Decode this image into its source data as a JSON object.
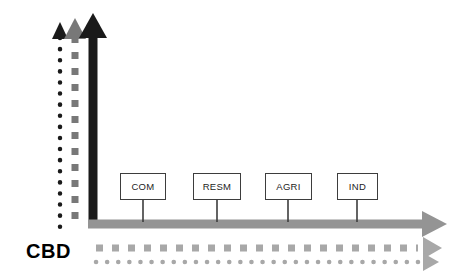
{
  "canvas": {
    "width": 460,
    "height": 278,
    "background": "#ffffff"
  },
  "colors": {
    "black": "#1a1a1a",
    "dark_gray": "#3d3d3d",
    "mid_gray": "#787878",
    "bar_gray": "#949494",
    "light_gray": "#a8a8a8",
    "box_border": "#3d3d3d",
    "box_fill": "#ffffff"
  },
  "cbd": {
    "label": "CBD",
    "x": 26,
    "y": 241
  },
  "nodes": [
    {
      "id": "com",
      "label": "COM",
      "x": 120,
      "y": 173,
      "width": 46,
      "height": 27,
      "connector_x": 143,
      "connector_y1": 200,
      "connector_y2": 221
    },
    {
      "id": "resm",
      "label": "RESM",
      "x": 193,
      "y": 173,
      "width": 48,
      "height": 27,
      "connector_x": 217,
      "connector_y1": 200,
      "connector_y2": 221
    },
    {
      "id": "agri",
      "label": "AGRI",
      "x": 265,
      "y": 173,
      "width": 47,
      "height": 27,
      "connector_x": 288,
      "connector_y1": 200,
      "connector_y2": 221
    },
    {
      "id": "ind",
      "label": "IND",
      "x": 337,
      "y": 173,
      "width": 41,
      "height": 27,
      "connector_x": 357,
      "connector_y1": 200,
      "connector_y2": 221
    }
  ],
  "vertical_axes": [
    {
      "id": "vertical-dotted-black",
      "style": "dotted",
      "color": "#1a1a1a",
      "x": 60,
      "top_y": 22,
      "bottom_y": 228,
      "line_width": 4.5,
      "arrow_half_width": 7,
      "arrow_height": 14
    },
    {
      "id": "vertical-dashed-gray",
      "style": "dashed",
      "color": "#787878",
      "x": 75,
      "top_y": 18,
      "bottom_y": 228,
      "line_width": 7,
      "arrow_half_width": 10,
      "arrow_height": 18
    },
    {
      "id": "vertical-solid-black",
      "style": "solid",
      "color": "#1a1a1a",
      "x": 93,
      "top_y": 13,
      "bottom_y": 228,
      "line_width": 9,
      "arrow_half_width": 14,
      "arrow_height": 24
    }
  ],
  "horizontal_axes": [
    {
      "id": "horizontal-solid-gray",
      "style": "solid",
      "color": "#949494",
      "y": 224,
      "start_x": 88,
      "end_x": 423,
      "line_width": 9,
      "arrow_half_height": 14,
      "arrow_length": 24
    },
    {
      "id": "horizontal-dashed-gray",
      "style": "dashed",
      "color": "#a8a8a8",
      "y": 248,
      "start_x": 95,
      "end_x": 423,
      "line_width": 7,
      "arrow_half_height": 11,
      "arrow_length": 19
    },
    {
      "id": "horizontal-dotted-gray",
      "style": "dotted",
      "color": "#a8a8a8",
      "y": 262,
      "start_x": 95,
      "end_x": 423,
      "line_width": 4.5,
      "arrow_half_height": 9,
      "arrow_length": 16
    }
  ]
}
